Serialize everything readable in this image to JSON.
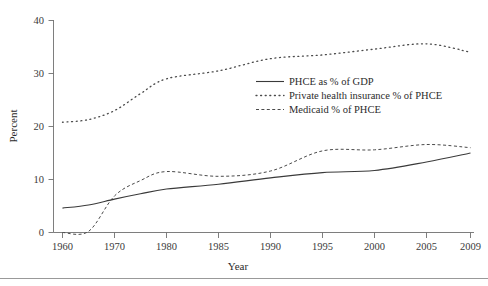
{
  "chart_data": {
    "type": "line",
    "title": "",
    "xlabel": "Year",
    "ylabel": "Percent",
    "ylim": [
      0,
      40
    ],
    "yticks": [
      0,
      10,
      20,
      30,
      40
    ],
    "ytick_labels": [
      "0",
      "10",
      "20",
      "30",
      "40"
    ],
    "xtick_labels": [
      "1960",
      "1970",
      "1980",
      "1985",
      "1990",
      "1995",
      "2000",
      "2005",
      "2009"
    ],
    "grid": false,
    "legend_position": "center-right inside plot",
    "series": [
      {
        "name": "PHCE as % of GDP",
        "style": "solid",
        "color": "#3a3a3a",
        "x": [
          1960,
          1965,
          1970,
          1975,
          1980,
          1985,
          1990,
          1995,
          2000,
          2005,
          2009
        ],
        "values": [
          4.6,
          5.2,
          6.3,
          7.3,
          8.2,
          9.1,
          10.3,
          11.3,
          11.7,
          13.3,
          15.0
        ]
      },
      {
        "name": "Private health insurance % of PHCE",
        "style": "dotted",
        "color": "#4a4a4a",
        "x": [
          1960,
          1965,
          1970,
          1975,
          1980,
          1985,
          1990,
          1995,
          2000,
          2005,
          2009
        ],
        "values": [
          20.8,
          21.3,
          23.0,
          26.2,
          29.0,
          30.5,
          32.8,
          33.5,
          34.6,
          35.6,
          34.0
        ]
      },
      {
        "name": "Medicaid % of PHCE",
        "style": "dashed",
        "color": "#4a4a4a",
        "x": [
          1960,
          1965,
          1970,
          1975,
          1980,
          1985,
          1990,
          1995,
          2000,
          2005,
          2009
        ],
        "values": [
          0.0,
          0.2,
          6.9,
          9.8,
          11.5,
          10.6,
          11.6,
          15.4,
          15.6,
          16.6,
          16.0
        ]
      }
    ],
    "legend_entries": [
      {
        "label": "PHCE as % of GDP",
        "style": "solid"
      },
      {
        "label": "Private health insurance % of PHCE",
        "style": "dotted"
      },
      {
        "label": "Medicaid % of PHCE",
        "style": "dashed"
      }
    ]
  }
}
